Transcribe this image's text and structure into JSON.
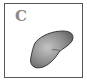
{
  "panel": {
    "label": "C",
    "shape": "kidney-shaped-object",
    "colors": {
      "border": "#555555",
      "label": "#888888",
      "shape_fill_light": "#b5b5b5",
      "shape_fill_dark": "#6e6e6e",
      "shape_outline": "#3a3a3a"
    }
  }
}
